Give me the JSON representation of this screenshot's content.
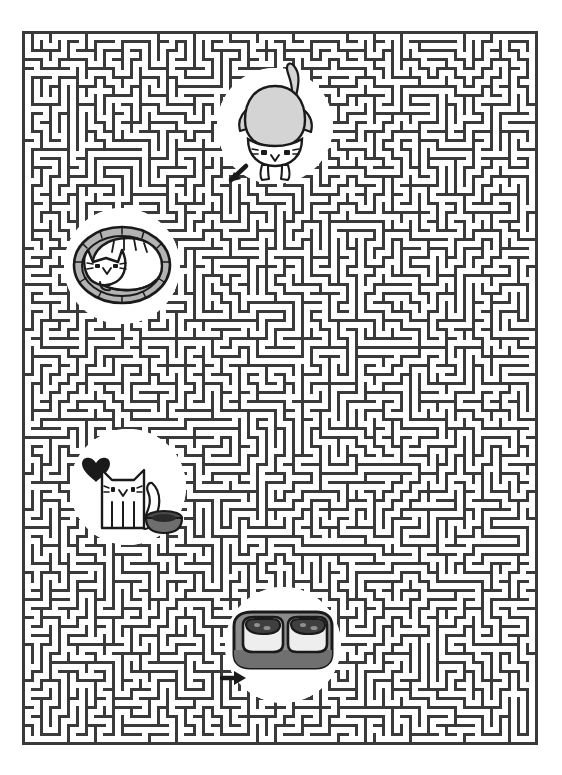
{
  "page": {
    "background_color": "#ffffff",
    "width": 562,
    "height": 775
  },
  "maze": {
    "name": "cat-maze",
    "wall_color": "#3a3a3a",
    "path_color": "#ffffff",
    "bounds": {
      "x": 22,
      "y": 31,
      "width": 515,
      "height": 714
    },
    "cell_size": 9,
    "wall_thickness": 3,
    "columns": 57,
    "rows": 79,
    "seed": 20240917
  },
  "stickers": [
    {
      "id": "cat-stretching",
      "name": "cat-stretching-sticker",
      "label": "Cat seen from behind with raised tail",
      "shape": "circle",
      "cx": 275,
      "cy": 126,
      "r": 58,
      "disc_color": "#ffffff",
      "body_color": "#d4d4d4",
      "outline_color": "#1a1a1a",
      "face_color": "#ffffff",
      "has_arrow": true,
      "arrow_direction": "down-left",
      "arrow_x": 238,
      "arrow_y": 172
    },
    {
      "id": "cat-sleeping",
      "name": "cat-sleeping-in-bed-sticker",
      "label": "Cat curled up asleep in a round bed",
      "shape": "circle",
      "cx": 122,
      "cy": 266,
      "r": 58,
      "disc_color": "#ffffff",
      "bed_color": "#b3b3b3",
      "body_color": "#ffffff",
      "outline_color": "#1a1a1a",
      "has_arrow": false
    },
    {
      "id": "cat-standing",
      "name": "cat-standing-with-heart-sticker",
      "label": "Standing cat with a heart and a food bowl",
      "shape": "circle",
      "cx": 128,
      "cy": 487,
      "r": 58,
      "disc_color": "#ffffff",
      "body_color": "#ffffff",
      "outline_color": "#1a1a1a",
      "heart_color": "#1a1a1a",
      "bowl_color": "#5a5a5a",
      "has_arrow": false
    },
    {
      "id": "food-bowls",
      "name": "double-food-bowl-sticker",
      "label": "Double cat food bowl",
      "shape": "circle",
      "cx": 283,
      "cy": 645,
      "r": 58,
      "disc_color": "#ffffff",
      "bowl_outer_color": "#8c8c8c",
      "bowl_inner_color": "#e8e8e8",
      "bowl_well_color": "#4a4a4a",
      "outline_color": "#1a1a1a",
      "has_arrow": true,
      "arrow_direction": "right",
      "arrow_x": 234,
      "arrow_y": 678
    }
  ]
}
